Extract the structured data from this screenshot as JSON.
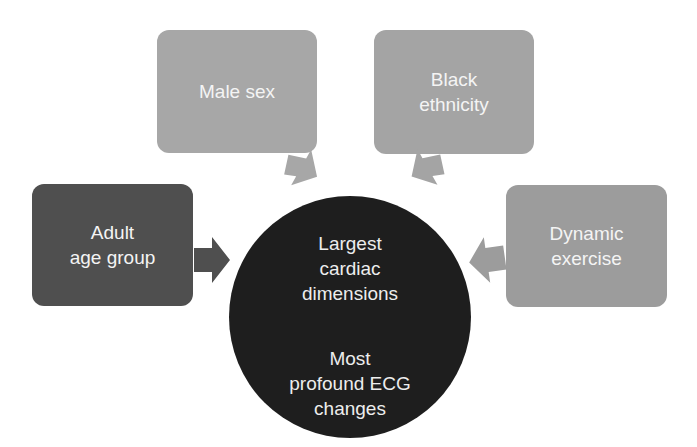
{
  "diagram": {
    "title": "",
    "center": {
      "line_group_1": [
        "Largest",
        "cardiac",
        "dimensions"
      ],
      "line_group_2": [
        "Most",
        "profound ECG",
        "changes"
      ],
      "color": "#1e1e1e"
    },
    "factors": [
      {
        "id": "male-sex",
        "lines": [
          "Male sex"
        ],
        "color": "#a7a7a7"
      },
      {
        "id": "black-ethnicity",
        "lines": [
          "Black",
          "ethnicity"
        ],
        "color": "#a4a4a4"
      },
      {
        "id": "adult-age-group",
        "lines": [
          "Adult",
          "age group"
        ],
        "color": "#4f4f4f"
      },
      {
        "id": "dynamic-exercise",
        "lines": [
          "Dynamic",
          "exercise"
        ],
        "color": "#9c9c9c"
      }
    ],
    "edges": [
      {
        "from": "male-sex",
        "to": "center"
      },
      {
        "from": "black-ethnicity",
        "to": "center"
      },
      {
        "from": "adult-age-group",
        "to": "center"
      },
      {
        "from": "dynamic-exercise",
        "to": "center"
      }
    ]
  }
}
